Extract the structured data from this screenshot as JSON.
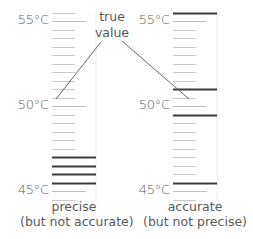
{
  "diagram": {
    "annotation": {
      "line1": "true",
      "line2": "value"
    },
    "colors": {
      "minor_tick": "#c8c8c8",
      "major_tick": "#bdbdbd",
      "reading": "#3a3a3a",
      "border": "#ececec",
      "text": "#5a5a5a",
      "connector": "#555555"
    },
    "scale": {
      "labels": [
        "55°C",
        "50°C",
        "45°C"
      ],
      "values": [
        55,
        50,
        45
      ],
      "min": 44.5,
      "max": 55.5,
      "minor_step": 0.5
    },
    "thermometers": [
      {
        "id": "precise",
        "caption_line1": "precise",
        "caption_line2": "(but not accurate)",
        "readings_c": [
          47.0,
          46.5,
          46.0,
          45.5
        ]
      },
      {
        "id": "accurate",
        "caption_line1": "accurate",
        "caption_line2": "(but not precise)",
        "readings_c": [
          55.5,
          51.0,
          49.5,
          45.5
        ]
      }
    ],
    "true_value_c": 50.5
  }
}
